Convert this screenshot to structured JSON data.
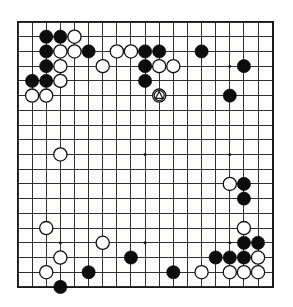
{
  "diagram": {
    "kind": "go-board-diagram",
    "board_size": 19,
    "colors": {
      "board_background": "#fdfdfc",
      "line": "#1a1a1a",
      "black_stone": "#0d0d0d",
      "white_stone": "#ffffff",
      "page_background": "#ffffff"
    },
    "geometry": {
      "origin_x": 18,
      "origin_y": 22,
      "spacing_x": 14.12,
      "spacing_y": 14.72,
      "stone_radius": 6.6
    },
    "star_points": [
      [
        3,
        3
      ],
      [
        9,
        3
      ],
      [
        15,
        3
      ],
      [
        3,
        9
      ],
      [
        9,
        9
      ],
      [
        15,
        9
      ],
      [
        3,
        15
      ],
      [
        9,
        15
      ],
      [
        15,
        15
      ]
    ],
    "black_stones": [
      [
        2,
        1
      ],
      [
        3,
        1
      ],
      [
        2,
        2
      ],
      [
        5,
        2
      ],
      [
        2,
        3
      ],
      [
        1,
        4
      ],
      [
        2,
        4
      ],
      [
        9,
        2
      ],
      [
        10,
        2
      ],
      [
        13,
        2
      ],
      [
        9,
        3
      ],
      [
        9,
        4
      ],
      [
        16,
        3
      ],
      [
        15,
        5
      ],
      [
        16,
        11
      ],
      [
        16,
        12
      ],
      [
        16,
        15
      ],
      [
        17,
        15
      ],
      [
        14,
        16
      ],
      [
        15,
        16
      ],
      [
        16,
        16
      ],
      [
        8,
        16
      ],
      [
        11,
        17
      ],
      [
        5,
        17
      ],
      [
        3,
        18
      ]
    ],
    "white_stones": [
      [
        4,
        1
      ],
      [
        3,
        2
      ],
      [
        4,
        2
      ],
      [
        3,
        3
      ],
      [
        6,
        3
      ],
      [
        3,
        4
      ],
      [
        1,
        5
      ],
      [
        2,
        5
      ],
      [
        7,
        2
      ],
      [
        8,
        2
      ],
      [
        10,
        3
      ],
      [
        11,
        3
      ],
      [
        10,
        5
      ],
      [
        3,
        9
      ],
      [
        15,
        11
      ],
      [
        16,
        14
      ],
      [
        2,
        14
      ],
      [
        6,
        15
      ],
      [
        3,
        16
      ],
      [
        17,
        16
      ],
      [
        2,
        17
      ],
      [
        13,
        17
      ],
      [
        15,
        17
      ],
      [
        16,
        17
      ],
      [
        17,
        17
      ]
    ],
    "markers": [
      {
        "type": "triangle",
        "col": 10,
        "row": 5,
        "on": "white"
      }
    ]
  }
}
